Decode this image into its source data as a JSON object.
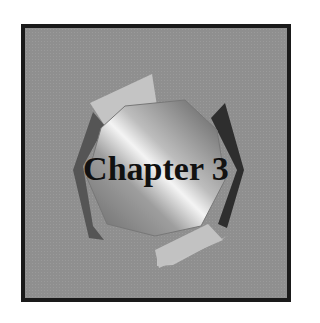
{
  "cover": {
    "title": "Chapter 3",
    "colors": {
      "frame_border": "#1a1a1a",
      "background": "#8f8f8f",
      "panel_light": "#c8c8c8",
      "panel_dark": "#3a3a3a"
    },
    "graphic": "octagon-gem"
  }
}
